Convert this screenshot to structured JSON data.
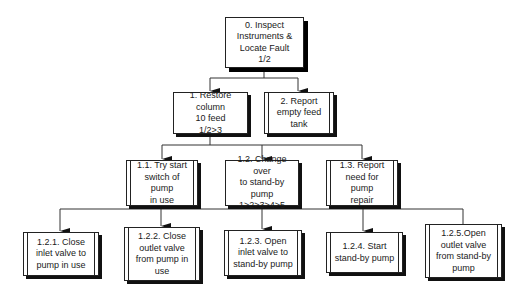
{
  "diagram": {
    "type": "hierarchical task analysis",
    "root": {
      "id": "0",
      "label": "0. Inspect\nInstruments &\nLocate Fault\n1/2"
    },
    "level1": [
      {
        "id": "1",
        "label": "1. Restore column\n10 feed\n1/2>3"
      },
      {
        "id": "2",
        "label": "2. Report\nempty feed\ntank"
      }
    ],
    "level2": [
      {
        "id": "1.1",
        "label": "1.1. Try start\nswitch of pump\nin use"
      },
      {
        "id": "1.2",
        "label": "1.2. Change over\nto stand-by pump\n1>2>3>4>5"
      },
      {
        "id": "1.3",
        "label": "1.3. Report\nneed for pump\nrepair"
      }
    ],
    "level3": [
      {
        "id": "1.2.1",
        "label": "1.2.1. Close\ninlet valve to\npump in use"
      },
      {
        "id": "1.2.2",
        "label": "1.2.2. Close\noutlet valve\nfrom pump in\nuse"
      },
      {
        "id": "1.2.3",
        "label": "1.2.3. Open\ninlet valve to\nstand-by pump"
      },
      {
        "id": "1.2.4",
        "label": "1.2.4. Start\nstand-by pump"
      },
      {
        "id": "1.2.5",
        "label": "1.2.5.Open\noutlet valve\nfrom stand-by\npump"
      }
    ]
  }
}
